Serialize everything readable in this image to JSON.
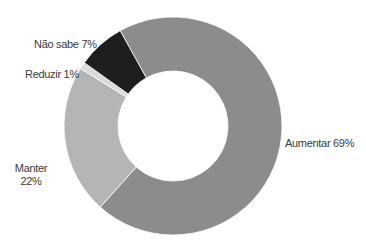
{
  "chart_data": {
    "type": "pie",
    "subtype": "donut",
    "title": "",
    "categories": [
      "Aumentar",
      "Manter",
      "Reduzir",
      "Não sabe"
    ],
    "values": [
      69,
      22,
      1,
      7
    ],
    "unit": "%",
    "colors": [
      "#8c8c8c",
      "#b5b5b5",
      "#dadada",
      "#1e1e1e"
    ],
    "labels": {
      "aumentar": "Aumentar 69%",
      "manter_name": "Manter",
      "manter_value": "22%",
      "reduzir": "Reduzir 1%",
      "nao_sabe": "Não sabe 7%"
    },
    "start_angle_deg": -29,
    "direction": "clockwise",
    "legend": "none (direct labels)"
  }
}
